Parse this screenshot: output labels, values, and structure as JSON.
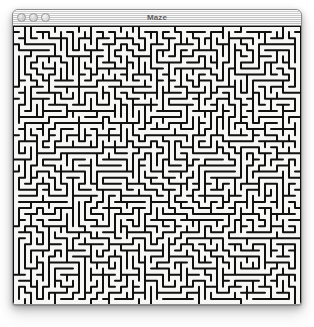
{
  "window": {
    "title": "Maze",
    "traffic_lights": [
      {
        "name": "close",
        "label": "Close",
        "color": "#cfcfcf"
      },
      {
        "name": "minimize",
        "label": "Minimize",
        "color": "#d4d4d4"
      },
      {
        "name": "zoom",
        "label": "Zoom",
        "color": "#dedede"
      }
    ],
    "frame": {
      "x": 12,
      "y": 9,
      "width": 290,
      "height": 296,
      "titlebar_height": 16,
      "border_color": "#8d8d8d"
    }
  },
  "maze": {
    "name": "maze-canvas",
    "description": "Dense rounded-corner maze filling the window body",
    "wall_color": "#111111",
    "background_color": "#f7f7f5",
    "cell_size": 6,
    "wall_thickness": 2.0,
    "corner_radius": 2.6,
    "cols": 48,
    "rows": 46,
    "seed": 20240617
  },
  "canvas": {
    "width": 314,
    "height": 327,
    "background": "#ffffff"
  }
}
